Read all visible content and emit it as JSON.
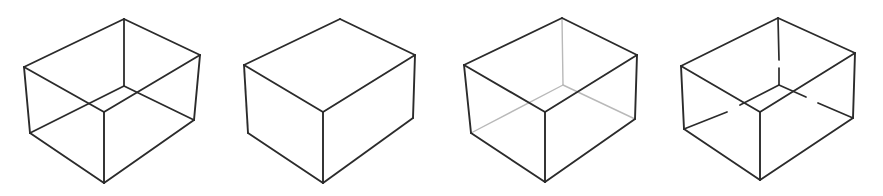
{
  "figure": {
    "background_color": "#ffffff",
    "canvas": {
      "width": 883,
      "height": 196
    },
    "panel_count": 4,
    "line_styles": {
      "visible_color": "#2b2b2b",
      "visible_width": 1.9,
      "hidden_color_faint": "#b9b9b9",
      "hidden_width_faint": 1.4,
      "hidden_color_gapped": "#2b2b2b",
      "hidden_width_gapped": 1.7
    },
    "panels": [
      {
        "index": 1,
        "name": "transparent-wireframe-cube",
        "label": "",
        "hidden_edge_treatment": "all edges drawn solid dark (full wireframe, Necker-cube ambiguity)",
        "vertices": {
          "top_back": [
            124,
            19
          ],
          "top_left": [
            24,
            67
          ],
          "top_right": [
            200,
            55
          ],
          "top_front": [
            104,
            112
          ],
          "bottom_left": [
            30,
            133
          ],
          "bottom_right": [
            194,
            120
          ],
          "bottom_front": [
            104,
            183
          ],
          "bottom_back": [
            124,
            86
          ]
        },
        "edges_visible": [
          "top_back-top_left",
          "top_back-top_right",
          "top_left-top_front",
          "top_right-top_front",
          "top_left-bottom_left",
          "top_right-bottom_right",
          "top_front-bottom_front",
          "bottom_left-bottom_front",
          "bottom_right-bottom_front"
        ],
        "edges_hidden": [
          "top_back-bottom_back",
          "bottom_back-bottom_left",
          "bottom_back-bottom_right"
        ]
      },
      {
        "index": 2,
        "name": "opaque-solid-cube",
        "label": "",
        "hidden_edge_treatment": "hidden edges omitted entirely (opaque solid)",
        "vertices": {
          "top_back": [
            340,
            19
          ],
          "top_left": [
            244,
            65
          ],
          "top_right": [
            415,
            55
          ],
          "top_front": [
            323,
            112
          ],
          "bottom_left": [
            248,
            133
          ],
          "bottom_right": [
            413,
            118
          ],
          "bottom_front": [
            323,
            183
          ]
        },
        "edges_visible": [
          "top_back-top_left",
          "top_back-top_right",
          "top_left-top_front",
          "top_right-top_front",
          "top_left-bottom_left",
          "top_right-bottom_right",
          "top_front-bottom_front",
          "bottom_left-bottom_front",
          "bottom_right-bottom_front"
        ],
        "edges_hidden": []
      },
      {
        "index": 3,
        "name": "faint-hidden-edge-cube",
        "label": "",
        "hidden_edge_treatment": "hidden edges drawn in light grey (see-through / ghosted)",
        "vertices": {
          "top_back": [
            562,
            18
          ],
          "top_left": [
            464,
            65
          ],
          "top_right": [
            637,
            55
          ],
          "top_front": [
            545,
            112
          ],
          "bottom_left": [
            471,
            133
          ],
          "bottom_right": [
            635,
            119
          ],
          "bottom_front": [
            545,
            182
          ],
          "bottom_back": [
            563,
            85
          ]
        },
        "edges_visible": [
          "top_back-top_left",
          "top_back-top_right",
          "top_left-top_front",
          "top_right-top_front",
          "top_left-bottom_left",
          "top_right-bottom_right",
          "top_front-bottom_front",
          "bottom_left-bottom_front",
          "bottom_right-bottom_front"
        ],
        "edges_hidden": [
          "top_back-bottom_back",
          "bottom_back-bottom_left",
          "bottom_back-bottom_right"
        ]
      },
      {
        "index": 4,
        "name": "gapped-hidden-edge-cube",
        "label": "",
        "hidden_edge_treatment": "hidden edges drawn dark but interrupted by gaps at crossings",
        "vertices": {
          "top_back": [
            778,
            18
          ],
          "top_left": [
            681,
            66
          ],
          "top_right": [
            855,
            53
          ],
          "top_front": [
            760,
            112
          ],
          "bottom_left": [
            684,
            129
          ],
          "bottom_right": [
            853,
            118
          ],
          "bottom_front": [
            760,
            180
          ],
          "bottom_back": [
            779,
            85
          ]
        },
        "edges_visible": [
          "top_back-top_left",
          "top_back-top_right",
          "top_left-top_front",
          "top_right-top_front",
          "top_left-bottom_left",
          "top_right-bottom_right",
          "top_front-bottom_front",
          "bottom_left-bottom_front",
          "bottom_right-bottom_front"
        ],
        "edges_hidden": [
          "top_back-bottom_back (gapped)",
          "bottom_back-bottom_left (gapped)",
          "bottom_back-bottom_right (gapped)"
        ]
      }
    ]
  }
}
